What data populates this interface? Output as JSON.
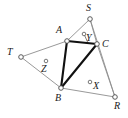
{
  "figure": {
    "background_color": "#ffffff",
    "thin_edge_color": "#8d8d8d",
    "thick_edge_color": "#111111",
    "vertex_fill_color": "#ffffff",
    "width": 128,
    "height": 118
  },
  "points": {
    "A": {
      "label": "A",
      "x": 67,
      "y": 41,
      "label_x": 56,
      "label_y": 25,
      "kind": "vertex"
    },
    "S": {
      "label": "S",
      "x": 90,
      "y": 19,
      "label_x": 86,
      "label_y": 3,
      "kind": "vertex"
    },
    "C": {
      "label": "C",
      "x": 97,
      "y": 44,
      "label_x": 102,
      "label_y": 39,
      "kind": "vertex"
    },
    "T": {
      "label": "T",
      "x": 21,
      "y": 57,
      "label_x": 7,
      "label_y": 47,
      "kind": "vertex"
    },
    "B": {
      "label": "B",
      "x": 61,
      "y": 88,
      "label_x": 55,
      "label_y": 93,
      "kind": "vertex"
    },
    "R": {
      "label": "R",
      "x": 115,
      "y": 97,
      "label_x": 114,
      "label_y": 101,
      "kind": "vertex"
    },
    "Y": {
      "label": "Y",
      "x": 84,
      "y": 34,
      "label_x": 86,
      "label_y": 33,
      "kind": "marker"
    },
    "Z": {
      "label": "Z",
      "x": 46,
      "y": 61,
      "label_x": 41,
      "label_y": 64,
      "kind": "marker"
    },
    "X": {
      "label": "X",
      "x": 90,
      "y": 82,
      "label_x": 93,
      "label_y": 81,
      "kind": "marker"
    }
  },
  "edges": {
    "outer_polygon": [
      {
        "name": "T-A",
        "from": "T",
        "to": "A",
        "weight": "thin"
      },
      {
        "name": "A-S",
        "from": "A",
        "to": "S",
        "weight": "thin"
      },
      {
        "name": "S-C",
        "from": "S",
        "to": "C",
        "weight": "thin"
      },
      {
        "name": "S-R",
        "from": "S",
        "to": "R",
        "weight": "thin"
      },
      {
        "name": "C-R",
        "from": "C",
        "to": "R",
        "weight": "thin"
      },
      {
        "name": "B-R",
        "from": "B",
        "to": "R",
        "weight": "thin"
      },
      {
        "name": "T-B",
        "from": "T",
        "to": "B",
        "weight": "thin"
      }
    ],
    "inner_triangle": [
      {
        "name": "A-B",
        "from": "A",
        "to": "B",
        "weight": "thick"
      },
      {
        "name": "B-C",
        "from": "B",
        "to": "C",
        "weight": "thick"
      },
      {
        "name": "C-A",
        "from": "C",
        "to": "A",
        "weight": "thick"
      }
    ],
    "connectors": [
      {
        "name": "Y-C",
        "from": "Y",
        "to": "C",
        "weight": "tick"
      }
    ]
  },
  "labels_order": [
    "S",
    "A",
    "C",
    "T",
    "Z",
    "B",
    "X",
    "R",
    "Y"
  ]
}
